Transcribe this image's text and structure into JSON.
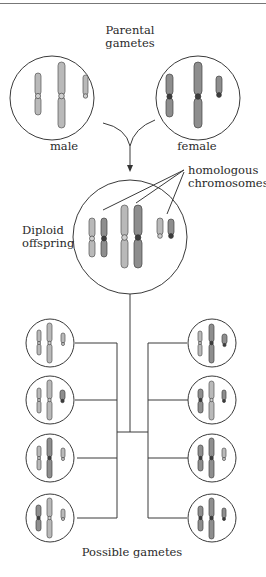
{
  "header": {
    "rule": true
  },
  "labels": {
    "parental_line1": "Parental",
    "parental_line2": "gametes",
    "male": "male",
    "female": "female",
    "homologous_line1": "homologous",
    "homologous_line2": "chromosomes",
    "diploid_line1": "Diploid",
    "diploid_line2": "offspring",
    "possible_gametes": "Possible gametes"
  },
  "colors": {
    "male_chromosome": "#b9b9b9",
    "female_chromosome": "#8e8e8e",
    "outline": "#3a3a3a"
  },
  "parents": [
    {
      "name": "male",
      "shade": "light"
    },
    {
      "name": "female",
      "shade": "dark"
    }
  ],
  "offspring": {
    "ploidy": "diploid",
    "pairs": 3
  },
  "gametes": {
    "count": 8,
    "left": [
      {
        "chr1": "light",
        "chr2": "light",
        "chr3": "light"
      },
      {
        "chr1": "light",
        "chr2": "light",
        "chr3": "dark"
      },
      {
        "chr1": "light",
        "chr2": "dark",
        "chr3": "light"
      },
      {
        "chr1": "dark",
        "chr2": "light",
        "chr3": "light"
      }
    ],
    "right": [
      {
        "chr1": "light",
        "chr2": "dark",
        "chr3": "dark"
      },
      {
        "chr1": "dark",
        "chr2": "light",
        "chr3": "dark"
      },
      {
        "chr1": "dark",
        "chr2": "dark",
        "chr3": "light"
      },
      {
        "chr1": "dark",
        "chr2": "dark",
        "chr3": "dark"
      }
    ]
  }
}
